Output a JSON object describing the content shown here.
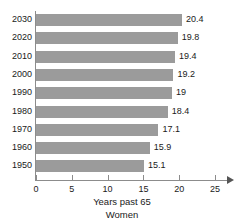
{
  "chart_data": {
    "type": "bar",
    "orientation": "horizontal",
    "title": "",
    "xlabel": "Years past 65",
    "subtitle": "Women",
    "ylabel": "",
    "categories": [
      "2030",
      "2020",
      "2010",
      "2000",
      "1990",
      "1980",
      "1970",
      "1960",
      "1950"
    ],
    "values": [
      20.4,
      19.8,
      19.4,
      19.2,
      19,
      18.4,
      17.1,
      15.9,
      15.1
    ],
    "value_labels": [
      "20.4",
      "19.8",
      "19.4",
      "19.2",
      "19",
      "18.4",
      "17.1",
      "15.9",
      "15.1"
    ],
    "xlim": [
      0,
      25
    ],
    "xticks": [
      0,
      5,
      10,
      15,
      20,
      25
    ],
    "xtick_labels": [
      "0",
      "5",
      "10",
      "15",
      "20",
      "25"
    ],
    "grid": false,
    "legend": false,
    "bar_color": "#9b9b9b",
    "axis_color": "#8c8c8c",
    "text_color": "#1a1a1a"
  }
}
